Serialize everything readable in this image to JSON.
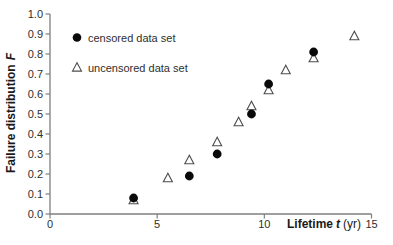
{
  "chart_data": {
    "type": "scatter",
    "title": "",
    "xlabel": "Lifetime t (yr)",
    "ylabel": "Failure distribution F",
    "xlabel_parts": {
      "bold": "Lifetime",
      "bold_italic": "t",
      "regular": "(yr)"
    },
    "ylabel_parts": {
      "bold": "Failure distribution",
      "bold_italic": "F"
    },
    "x_axis": {
      "min": 0,
      "max": 15,
      "ticks": [
        0,
        5,
        10,
        15
      ]
    },
    "y_axis": {
      "min": 0.0,
      "max": 1.0,
      "ticks": [
        "0.0",
        "0.1",
        "0.2",
        "0.3",
        "0.4",
        "0.5",
        "0.6",
        "0.7",
        "0.8",
        "0.9",
        "1.0"
      ]
    },
    "grid": false,
    "legend_position": "inside-top-left",
    "series": [
      {
        "name": "censored data set",
        "marker": "filled-circle",
        "color": "#0a0a0a",
        "points": [
          {
            "t": 3.9,
            "F": 0.08
          },
          {
            "t": 6.5,
            "F": 0.19
          },
          {
            "t": 7.8,
            "F": 0.3
          },
          {
            "t": 9.4,
            "F": 0.5
          },
          {
            "t": 10.2,
            "F": 0.65
          },
          {
            "t": 12.3,
            "F": 0.81
          }
        ]
      },
      {
        "name": "uncensored data set",
        "marker": "open-triangle",
        "color": "#4d4d4d",
        "points": [
          {
            "t": 3.9,
            "F": 0.07
          },
          {
            "t": 5.5,
            "F": 0.18
          },
          {
            "t": 6.5,
            "F": 0.27
          },
          {
            "t": 7.8,
            "F": 0.36
          },
          {
            "t": 8.8,
            "F": 0.46
          },
          {
            "t": 9.4,
            "F": 0.54
          },
          {
            "t": 10.2,
            "F": 0.62
          },
          {
            "t": 11.0,
            "F": 0.72
          },
          {
            "t": 12.3,
            "F": 0.78
          },
          {
            "t": 14.2,
            "F": 0.89
          }
        ]
      }
    ],
    "colors": {
      "axis": "#7f7f7f",
      "tick_text": "#2e2e2e",
      "circle_fill": "#0a0a0a",
      "triangle_stroke": "#4d4d4d",
      "triangle_fill": "#ffffff",
      "background": "#ffffff"
    }
  }
}
